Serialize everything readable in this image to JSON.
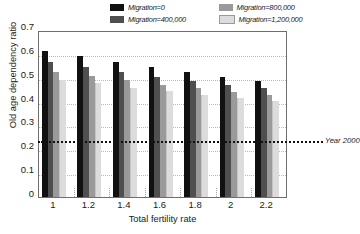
{
  "chart_data": {
    "type": "bar",
    "title": "",
    "subtitle": "",
    "xlabel": "Total fertility rate",
    "ylabel": "Old age dependency ratio",
    "categories": [
      "1",
      "1.2",
      "1.4",
      "1.6",
      "1.8",
      "2",
      "2.2"
    ],
    "series": [
      {
        "name": "Migration=0",
        "color": "#111111",
        "values": [
          0.613,
          0.59,
          0.566,
          0.545,
          0.524,
          0.505,
          0.487
        ]
      },
      {
        "name": "Migration=400,000",
        "color": "#4f4f4f",
        "values": [
          0.565,
          0.545,
          0.525,
          0.505,
          0.487,
          0.471,
          0.455
        ]
      },
      {
        "name": "Migration=800,000",
        "color": "#9a9a9a",
        "values": [
          0.525,
          0.508,
          0.489,
          0.471,
          0.455,
          0.441,
          0.427
        ]
      },
      {
        "name": "Migration=1,200,000",
        "color": "#dcdcdc",
        "values": [
          0.492,
          0.476,
          0.458,
          0.443,
          0.429,
          0.417,
          0.404
        ]
      }
    ],
    "ylim": [
      0,
      0.7
    ],
    "ytick_values": [
      0,
      0.1,
      0.2,
      0.3,
      0.4,
      0.5,
      0.6,
      0.7
    ],
    "ytick_labels": [
      "0",
      "0.1",
      "0.2",
      "0.3",
      "0.4",
      "0.5",
      "0.6",
      "0.7"
    ],
    "grid": true,
    "grid_axis": "y",
    "legend_position": "top",
    "annotations": [
      {
        "name": "year-2000-reference",
        "label": "Year 2000",
        "type": "hline",
        "value": 0.24
      }
    ]
  }
}
